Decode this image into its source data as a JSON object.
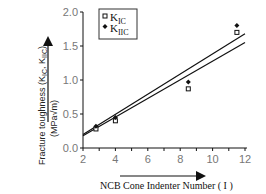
{
  "chart_data": {
    "type": "scatter",
    "title": "",
    "xlabel": "NCB Cone Indenter Number ( I )",
    "ylabel": "Fracture toughness (K_IC, K_IIC) (MPa√m)",
    "ylabel_line1": "Fracture toughness (K",
    "ylabel_line2": "(MPa√m)",
    "xlim": [
      2,
      12
    ],
    "ylim": [
      0.0,
      2.0
    ],
    "x_ticks": [
      2,
      4,
      6,
      8,
      10,
      12
    ],
    "x_tick_labels": [
      "2",
      "4",
      "6",
      "8",
      "10",
      "12"
    ],
    "y_ticks": [
      0.0,
      0.5,
      1.0,
      1.5,
      2.0
    ],
    "y_tick_labels": [
      "0.0",
      "0.5",
      "1.0",
      "1.5",
      "2.0"
    ],
    "grid": false,
    "legend_position": "upper right",
    "series": [
      {
        "name": "K_IC",
        "marker": "open-square",
        "x": [
          2.8,
          4.0,
          8.5,
          11.5
        ],
        "y": [
          0.28,
          0.4,
          0.87,
          1.7
        ]
      },
      {
        "name": "K_IIC",
        "marker": "filled-diamond",
        "x": [
          2.8,
          4.0,
          8.5,
          11.5
        ],
        "y": [
          0.32,
          0.45,
          0.97,
          1.8
        ]
      }
    ],
    "fit_lines": [
      {
        "name": "K_IIC fit",
        "x": [
          2,
          12
        ],
        "y": [
          0.2,
          1.68
        ]
      },
      {
        "name": "K_IC fit",
        "x": [
          2,
          12
        ],
        "y": [
          0.18,
          1.55
        ]
      }
    ]
  },
  "legend": {
    "items": [
      {
        "symbol": "□",
        "main": "K",
        "sub": "IC"
      },
      {
        "symbol": "◆",
        "main": "K",
        "sub": "IIC"
      }
    ]
  },
  "labels": {
    "xlabel": "NCB Cone Indenter Number ( I )",
    "ylabel_line1": "Fracture toughness (K",
    "ylabel_sub1": "IC",
    "ylabel_mid": ", K",
    "ylabel_sub2": "IIC",
    "ylabel_end": ")",
    "ylabel_line2": "(MPa√m)"
  }
}
